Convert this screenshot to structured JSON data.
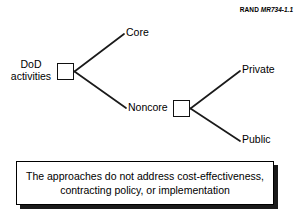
{
  "figure": {
    "credit": {
      "publisher": "RAND",
      "document_number": "MR734-1.1"
    },
    "tree": {
      "root_label": "DoD\nactivities",
      "root_label_line1": "DoD",
      "root_label_line2": "activities",
      "branches": {
        "core": "Core",
        "noncore": "Noncore",
        "private": "Private",
        "public": "Public"
      }
    },
    "caption": {
      "line1": "The approaches do not address cost-effectiveness,",
      "line2": "contracting policy, or implementation"
    },
    "colors": {
      "background": "#ffffff",
      "ink": "#000000",
      "line": "#1a1a1a",
      "shadow": "#1a1a1a"
    }
  }
}
